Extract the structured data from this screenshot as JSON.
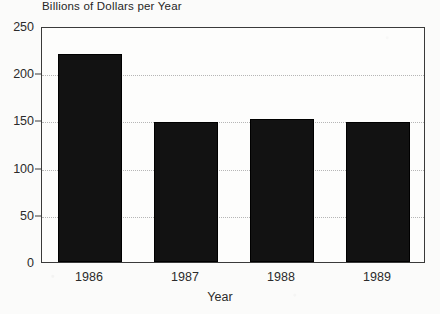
{
  "chart_data": {
    "type": "bar",
    "title": "Billions of Dollars per Year",
    "xlabel": "Year",
    "ylabel": "",
    "categories": [
      "1986",
      "1987",
      "1988",
      "1989"
    ],
    "values": [
      220,
      148,
      152,
      148
    ],
    "ylim": [
      0,
      250
    ],
    "yticks": [
      0,
      50,
      100,
      150,
      200,
      250
    ],
    "ytick_labels": [
      "0",
      "50",
      "100",
      "150",
      "200",
      "250"
    ],
    "grid": "horizontal-dotted",
    "legend": "none",
    "bar_color": "#121212",
    "axis_color": "#3a3a3a",
    "grid_color": "#b6b6b6",
    "background_color": "#fbfbfa"
  },
  "axes": {
    "y_ticks": [
      {
        "label": "250",
        "value": 250
      },
      {
        "label": "200",
        "value": 200
      },
      {
        "label": "150",
        "value": 150
      },
      {
        "label": "100",
        "value": 100
      },
      {
        "label": "50",
        "value": 50
      },
      {
        "label": "0",
        "value": 0
      }
    ],
    "x_ticks": [
      {
        "label": "1986"
      },
      {
        "label": "1987"
      },
      {
        "label": "1988"
      },
      {
        "label": "1989"
      }
    ]
  }
}
